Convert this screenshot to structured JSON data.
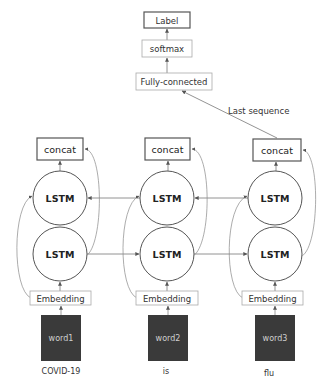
{
  "diagram": {
    "head": {
      "label": "Label",
      "softmax": "softmax",
      "fully_connected": "Fully-connected",
      "edge_label": "Last sequence"
    },
    "columns": [
      {
        "concat": "concat",
        "lstm_backward": "LSTM",
        "lstm_forward": "LSTM",
        "embedding": "Embedding",
        "word": "word1",
        "token": "COVID-19"
      },
      {
        "concat": "concat",
        "lstm_backward": "LSTM",
        "lstm_forward": "LSTM",
        "embedding": "Embedding",
        "word": "word2",
        "token": "is"
      },
      {
        "concat": "concat",
        "lstm_backward": "LSTM",
        "lstm_forward": "LSTM",
        "embedding": "Embedding",
        "word": "word3",
        "token": "flu"
      }
    ],
    "colors": {
      "stroke": "#555555",
      "light_border": "#aaaaaa",
      "word_fill": "#3a3a3a"
    }
  }
}
